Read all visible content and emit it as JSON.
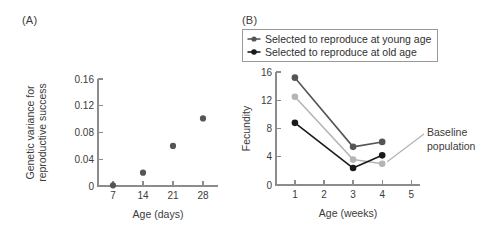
{
  "figure": {
    "panel_a_label": "(A)",
    "panel_b_label": "(B)"
  },
  "colors": {
    "axis": "#8c8c8c",
    "text": "#3b3b3b",
    "dark_gray_series": "#555555",
    "black_series": "#1a1a1a",
    "light_gray_series": "#b5b5b5",
    "legend_border": "#9a9a9a",
    "leader_line": "#b0b0b0"
  },
  "legend": {
    "items": [
      {
        "label": "Selected to reproduce at young age",
        "marker_color": "#555555"
      },
      {
        "label": "Selected to reproduce at old age",
        "marker_color": "#1a1a1a"
      }
    ]
  },
  "annotations": {
    "baseline_line1": "Baseline",
    "baseline_line2": "population"
  },
  "chart_data": [
    {
      "id": "panel_a",
      "type": "scatter",
      "title": "(A)",
      "xlabel": "Age (days)",
      "ylabel": "Genetic variance for reproductive success",
      "ylabel_line1": "Genetic variance for",
      "ylabel_line2": "reproductive success",
      "xlim": [
        3.5,
        31.5
      ],
      "ylim": [
        0,
        0.16
      ],
      "xticks": [
        7,
        14,
        21,
        28
      ],
      "xtick_labels": [
        "7",
        "14",
        "21",
        "28"
      ],
      "yticks": [
        0,
        0.04,
        0.08,
        0.12,
        0.16
      ],
      "ytick_labels": [
        "0",
        "0.04",
        "0.08",
        "0.12",
        "0.16"
      ],
      "grid": false,
      "legend_position": "none",
      "series": [
        {
          "name": "Genetic variance",
          "color": "#555555",
          "marker": "filled-circle",
          "x": [
            7,
            14,
            21,
            28
          ],
          "values": [
            0.001,
            0.02,
            0.06,
            0.101
          ]
        }
      ]
    },
    {
      "id": "panel_b",
      "type": "line",
      "title": "(B)",
      "xlabel": "Age (weeks)",
      "ylabel": "Fecundity",
      "xlim": [
        0.35,
        5.3
      ],
      "ylim": [
        0,
        16
      ],
      "xticks": [
        1,
        2,
        3,
        4,
        5
      ],
      "xtick_labels": [
        "1",
        "2",
        "3",
        "4",
        "5"
      ],
      "yticks": [
        0,
        4,
        8,
        12,
        16
      ],
      "ytick_labels": [
        "0",
        "4",
        "8",
        "12",
        "16"
      ],
      "grid": false,
      "legend_position": "top-left",
      "x": [
        1,
        3,
        4
      ],
      "series": [
        {
          "name": "Selected to reproduce at young age",
          "color": "#555555",
          "marker": "filled-circle",
          "values": [
            15.2,
            5.4,
            6.1
          ]
        },
        {
          "name": "Baseline population",
          "color": "#b5b5b5",
          "marker": "filled-circle",
          "values": [
            12.5,
            3.6,
            3.0
          ]
        },
        {
          "name": "Selected to reproduce at old age",
          "color": "#1a1a1a",
          "marker": "filled-circle",
          "values": [
            8.8,
            2.4,
            4.2
          ]
        }
      ]
    }
  ]
}
